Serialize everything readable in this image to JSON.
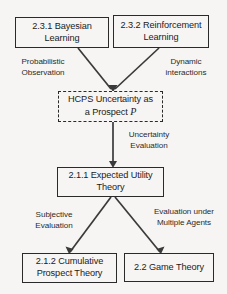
{
  "diagram": {
    "type": "flowchart",
    "background_color": "#f6f5f3",
    "line_color": "#3a3a3a",
    "text_color": "#1b1b1b",
    "nodes": [
      {
        "id": "bayesian",
        "line1": "2.3.1 Bayesian",
        "line2": "Learning",
        "border": "solid"
      },
      {
        "id": "reinforcement",
        "line1": "2.3.2 Reinforcement",
        "line2": "Learning",
        "border": "solid"
      },
      {
        "id": "hcps",
        "line1": "HCPS Uncertainty as",
        "line2_prefix": "a Prospect ",
        "line2_symbol": "P",
        "border": "dashed"
      },
      {
        "id": "expected-utility",
        "line1": "2.1.1 Expected Utility",
        "line2": "Theory",
        "border": "solid"
      },
      {
        "id": "cumulative-prospect",
        "line1": "2.1.2 Cumulative",
        "line2": "Prospect Theory",
        "border": "solid"
      },
      {
        "id": "game-theory",
        "line1": "2.2 Game Theory",
        "line2": "",
        "border": "solid"
      }
    ],
    "edge_labels": [
      {
        "id": "probabilistic-observation",
        "line1": "Probabilistic",
        "line2": "Observation",
        "from": "bayesian",
        "to": "hcps"
      },
      {
        "id": "dynamic-interactions",
        "line1": "Dynamic",
        "line2": "interactions",
        "from": "reinforcement",
        "to": "hcps"
      },
      {
        "id": "uncertainty-evaluation",
        "line1": "Uncertainty",
        "line2": "Evaluation",
        "from": "hcps",
        "to": "expected-utility"
      },
      {
        "id": "subjective-evaluation",
        "line1": "Subjective",
        "line2": "Evaluation",
        "from": "expected-utility",
        "to": "cumulative-prospect"
      },
      {
        "id": "multiple-agents",
        "line1": "Evaluation under",
        "line2": "Multiple Agents",
        "from": "expected-utility",
        "to": "game-theory"
      }
    ]
  }
}
